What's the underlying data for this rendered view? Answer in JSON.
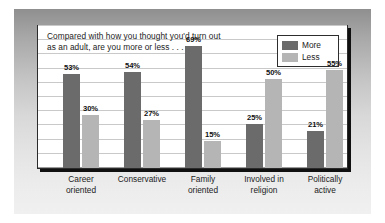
{
  "chart_data": {
    "type": "bar",
    "title": "Compared with how you thought you'd turn out\nas an adult, are you more or less . . .",
    "xlabel": "",
    "ylabel": "",
    "ylim": [
      0,
      80
    ],
    "grid": true,
    "grid_axis": "y",
    "legend_position": "top-right",
    "categories": [
      "Career\noriented",
      "Conservative",
      "Family\noriented",
      "Involved in\nreligion",
      "Politically\nactive"
    ],
    "series": [
      {
        "name": "More",
        "color": "#6b6b6b",
        "values": [
          53,
          54,
          69,
          25,
          21
        ],
        "labels": [
          "53%",
          "54%",
          "69%",
          "25%",
          "21%"
        ]
      },
      {
        "name": "Less",
        "color": "#b5b5b5",
        "values": [
          30,
          27,
          15,
          50,
          55
        ],
        "labels": [
          "30%",
          "27%",
          "15%",
          "50%",
          "55%"
        ]
      }
    ]
  },
  "legend": {
    "entries": [
      {
        "label": "More",
        "color": "#6b6b6b"
      },
      {
        "label": "Less",
        "color": "#b5b5b5"
      }
    ]
  },
  "colors": {
    "more_bar": "#6b6b6b",
    "less_bar": "#b5b5b5",
    "gridline": "#c9c9c9",
    "panel_background": "#ffffff",
    "panel_border": "#2b2b2b",
    "panel_shadow": "#101010",
    "mat_top": "#8f8f8f",
    "mat_bottom": "#f0f0f0",
    "text": "#1b1b1b"
  }
}
